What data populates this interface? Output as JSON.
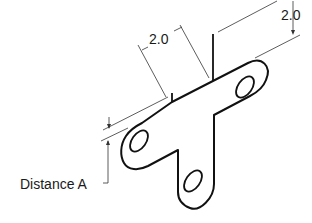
{
  "diagram": {
    "type": "isometric-mechanical-drawing",
    "part": "T-shaped bracket plate with three holes",
    "dimensions": [
      {
        "id": "dim-left",
        "label": "2.0"
      },
      {
        "id": "dim-right",
        "label": "2.0"
      }
    ],
    "callout": {
      "label": "Distance A"
    },
    "colors": {
      "outline": "#111111",
      "dimension_line": "#333333",
      "background": "#ffffff"
    }
  }
}
